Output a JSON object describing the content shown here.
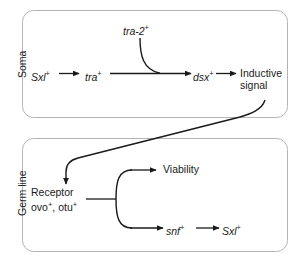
{
  "figure": {
    "type": "pathway-diagram",
    "background_color": "#ffffff",
    "line_color": "#1a1a1a",
    "box_border_color": "#b4b4b4"
  },
  "compartments": [
    {
      "id": "soma",
      "label": "Soma"
    },
    {
      "id": "germ_line",
      "label": "Germ line"
    }
  ],
  "soma": {
    "nodes": {
      "sxl": {
        "text": "Sxl",
        "superscript": "+"
      },
      "tra": {
        "text": "tra",
        "superscript": "+"
      },
      "tra2": {
        "text": "tra-2",
        "superscript": "+"
      },
      "dsx": {
        "text": "dsx",
        "superscript": "+"
      },
      "inductive_signal_line1": "Inductive",
      "inductive_signal_line2": "signal"
    }
  },
  "germ_line": {
    "nodes": {
      "receptor": "Receptor",
      "receptor_genes_ovo": "ovo",
      "receptor_genes_ovo_sup": "+",
      "receptor_genes_sep": ", ",
      "receptor_genes_otu": "otu",
      "receptor_genes_otu_sup": "+",
      "viability": "Viability",
      "snf": {
        "text": "snf",
        "superscript": "+"
      },
      "sxl": {
        "text": "Sxl",
        "superscript": "+"
      }
    }
  },
  "edges": [
    {
      "from": "Sxl+",
      "to": "tra+",
      "style": "arrow"
    },
    {
      "from": "tra+",
      "to": "dsx+",
      "style": "arrow"
    },
    {
      "from": "tra-2+",
      "to": "dsx+",
      "style": "curved-arrow"
    },
    {
      "from": "dsx+",
      "to": "Inductive signal",
      "style": "arrow"
    },
    {
      "from": "Inductive signal",
      "to": "Receptor",
      "style": "long-curved-arrow"
    },
    {
      "from": "Receptor / ovo+, otu+",
      "to": "Viability",
      "style": "bracket-arrow"
    },
    {
      "from": "Receptor / ovo+, otu+",
      "to": "snf+",
      "style": "bracket-arrow"
    },
    {
      "from": "snf+",
      "to": "Sxl+",
      "style": "arrow"
    }
  ]
}
